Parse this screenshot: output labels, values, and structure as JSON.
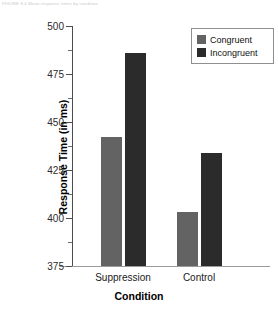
{
  "caption": "FIGURE 8.4   Mean response times by condition",
  "chart_data": {
    "type": "bar",
    "title": "",
    "xlabel": "Condition",
    "ylabel": "Response Time (in ms)",
    "categories": [
      "Suppression",
      "Control"
    ],
    "series": [
      {
        "name": "Congruent",
        "color": "#636363",
        "values": [
          442,
          403
        ]
      },
      {
        "name": "Incongruent",
        "color": "#2b2b2b",
        "values": [
          486,
          434
        ]
      }
    ],
    "ylim": [
      375,
      500
    ],
    "yticks": [
      375,
      400,
      425,
      450,
      475,
      500
    ],
    "ytick_labels": [
      "375",
      "400",
      "425",
      "450",
      "475",
      "500"
    ],
    "yminor_ticks": [
      387.5,
      412.5,
      437.5,
      462.5,
      487.5
    ],
    "grid": false,
    "legend_position": "top-right",
    "legend_entries": [
      "Congruent",
      "Incongruent"
    ]
  },
  "colors": {
    "congruent": "#636363",
    "incongruent": "#2b2b2b",
    "axis": "#4d4d4d",
    "background": "#ffffff"
  }
}
